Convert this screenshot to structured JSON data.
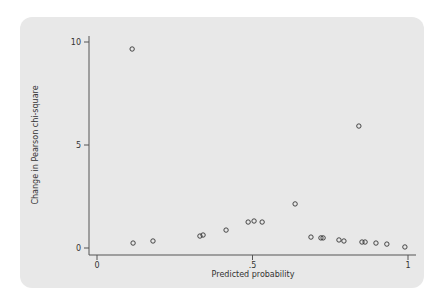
{
  "chart_data": {
    "type": "scatter",
    "title": "",
    "xlabel": "Predicted probability",
    "ylabel": "Change in Pearson chi-square",
    "xlim": [
      0,
      1
    ],
    "ylim": [
      0,
      10
    ],
    "xticks": [
      {
        "value": 0,
        "label": "0"
      },
      {
        "value": 0.5,
        "label": ".5"
      },
      {
        "value": 1,
        "label": "1"
      }
    ],
    "yticks": [
      {
        "value": 0,
        "label": "0"
      },
      {
        "value": 5,
        "label": "5"
      },
      {
        "value": 10,
        "label": "10"
      }
    ],
    "grid": false,
    "legend": null,
    "marker": "hollow-circle",
    "series": [
      {
        "name": "points",
        "x": [
          0.113,
          0.116,
          0.18,
          0.331,
          0.341,
          0.415,
          0.486,
          0.505,
          0.531,
          0.637,
          0.688,
          0.72,
          0.727,
          0.778,
          0.794,
          0.842,
          0.852,
          0.862,
          0.897,
          0.932,
          0.99
        ],
        "y": [
          9.66,
          0.24,
          0.34,
          0.58,
          0.63,
          0.87,
          1.26,
          1.31,
          1.26,
          2.14,
          0.53,
          0.49,
          0.49,
          0.39,
          0.34,
          5.92,
          0.29,
          0.29,
          0.24,
          0.19,
          0.05
        ]
      }
    ]
  },
  "colors": {
    "panel_background": "#e8e8e8",
    "axis": "#555555",
    "marker": "#333333"
  }
}
